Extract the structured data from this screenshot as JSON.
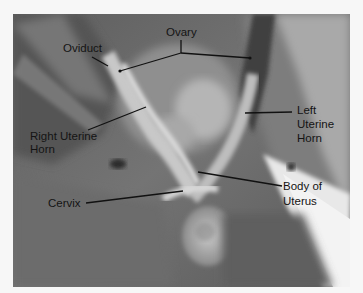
{
  "figure": {
    "type": "anatomical-photograph",
    "colors": {
      "background": "#f7f7f7",
      "label_text": "#141414",
      "leader_line": "#111111"
    }
  },
  "labels": {
    "oviduct": "Oviduct",
    "ovary": "Ovary",
    "right_uterine_horn_line1": "Right Uterine",
    "right_uterine_horn_line2": "Horn",
    "left_uterine_horn_line1": "Left",
    "left_uterine_horn_line2": "Uterine",
    "left_uterine_horn_line3": "Horn",
    "cervix": "Cervix",
    "body_of_uterus_line1": "Body of",
    "body_of_uterus_line2": "Uterus"
  }
}
